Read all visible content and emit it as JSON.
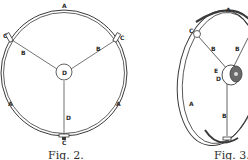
{
  "figures": [
    {
      "id": "fig2",
      "caption": "Fig. 2.",
      "view": "front",
      "labels": {
        "rim_top": "A",
        "rim_left": "A",
        "rim_right": "A",
        "spoke_left": "B",
        "spoke_right": "B",
        "spoke_bottom": "D",
        "hub": "D",
        "clamp_left": "C",
        "clamp_right": "C",
        "clamp_bottom": "C"
      }
    },
    {
      "id": "fig3",
      "caption": "Fig. 3.",
      "view": "perspective",
      "labels": {
        "rim_top": "A",
        "rim_left": "A",
        "clamp_top": "C",
        "spoke_left": "B",
        "spoke_right": "B",
        "spoke_bottom": "B",
        "hub": "E",
        "hub_sub": "D"
      }
    }
  ],
  "colors": {
    "ink": "#3a3a3a",
    "paper": "#ffffff"
  }
}
